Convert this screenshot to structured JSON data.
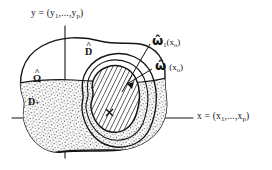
{
  "figure": {
    "background_color": "#ffffff",
    "ink_color": "#141414"
  },
  "axes": {
    "y_axis": {
      "name": "y-axis",
      "label_prefix": "y = (y",
      "label_sub_first": "1",
      "label_mid": ",...,y",
      "label_sub_last": "p",
      "label_suffix": ")",
      "full_label": "y = (y1,...,yp)"
    },
    "x_axis": {
      "name": "x-axis",
      "label_prefix": "x = (x",
      "label_sub_first": "1",
      "label_mid": ",...,x",
      "label_sub_last": "p",
      "label_suffix": ")",
      "full_label": "x = (x1,...,xp)"
    }
  },
  "regions": {
    "outer": {
      "name": "D-hat region",
      "label_base": "D",
      "label_hat": "^",
      "full_label": "D̂"
    },
    "band": {
      "name": "Omega-hat band",
      "label_base": "Ω",
      "label_hat": "^",
      "full_label": "Ω̂",
      "fill": "stipple"
    },
    "band_lower": {
      "name": "D-plus region",
      "label_base": "D",
      "label_suffix": "+",
      "full_label": "D+"
    },
    "inner": {
      "name": "omega-hat inner region",
      "fill": "hatched"
    }
  },
  "callouts": [
    {
      "id": "omega-1",
      "symbol": "ω̂",
      "subscript": "1",
      "argument_open": "(x",
      "argument_sub": "o",
      "argument_close": ")",
      "full_label": "ω̂1(xo)"
    },
    {
      "id": "omega",
      "symbol": "ω̂",
      "subscript": "",
      "argument_open": "(x",
      "argument_sub": "o",
      "argument_close": ")",
      "full_label": "ω̂(xo)"
    }
  ],
  "markers": {
    "point_x0": {
      "name": "point-x0",
      "label": "x"
    }
  }
}
